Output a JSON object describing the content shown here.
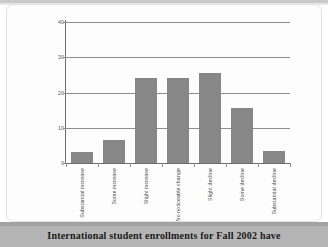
{
  "chart_data": {
    "type": "bar",
    "title": "",
    "xlabel": "",
    "ylabel": "",
    "categories": [
      "Substantial increase",
      "Some increase",
      "Slight increase",
      "No noticeable change",
      "Slight decline",
      "Some decline",
      "Substantial decline"
    ],
    "values": [
      3,
      6.5,
      24,
      24,
      25.5,
      15.5,
      3.5
    ],
    "ylim": [
      0,
      40
    ],
    "yticks": [
      0,
      10,
      20,
      30,
      40
    ],
    "ytick_labels": [
      "0",
      "10",
      "20",
      "30",
      "40"
    ],
    "grid": true,
    "legend": "none",
    "bar_color": "#878787",
    "gridline_color": "#8d8d8d",
    "axis_color": "#6d6d6d"
  },
  "caption": {
    "text": "International student enrollments for Fall 2002 have"
  },
  "colors": {
    "background": "#ffffff",
    "caption_band": "#b5b5b5",
    "caption_text": "#1a1a1a",
    "page_border": "#e2e2e2"
  }
}
